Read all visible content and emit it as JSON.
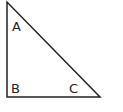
{
  "diagram": {
    "type": "right-triangle",
    "stroke_color": "#222222",
    "background": "#ffffff",
    "vertices": {
      "A": {
        "label": "A",
        "x": 7,
        "y": 2
      },
      "B": {
        "label": "B",
        "x": 7,
        "y": 97
      },
      "C": {
        "label": "C",
        "x": 100,
        "y": 97
      }
    },
    "labels": [
      {
        "id": "A",
        "text": "A",
        "x": 12,
        "y": 31
      },
      {
        "id": "B",
        "text": "B",
        "x": 11,
        "y": 93
      },
      {
        "id": "C",
        "text": "C",
        "x": 69,
        "y": 93
      }
    ],
    "right_angle_at": "B"
  }
}
